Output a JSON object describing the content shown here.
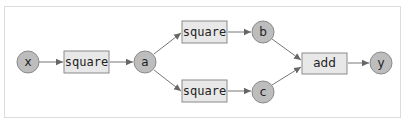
{
  "diagram": {
    "type": "computation-graph",
    "nodes": {
      "x": {
        "label": "x",
        "kind": "variable"
      },
      "sq1": {
        "label": "square",
        "kind": "function"
      },
      "a": {
        "label": "a",
        "kind": "variable"
      },
      "sq2": {
        "label": "square",
        "kind": "function"
      },
      "sq3": {
        "label": "square",
        "kind": "function"
      },
      "b": {
        "label": "b",
        "kind": "variable"
      },
      "c": {
        "label": "c",
        "kind": "variable"
      },
      "add": {
        "label": "add",
        "kind": "function"
      },
      "y": {
        "label": "y",
        "kind": "variable"
      }
    },
    "edges": [
      [
        "x",
        "sq1"
      ],
      [
        "sq1",
        "a"
      ],
      [
        "a",
        "sq2"
      ],
      [
        "a",
        "sq3"
      ],
      [
        "sq2",
        "b"
      ],
      [
        "sq3",
        "c"
      ],
      [
        "b",
        "add"
      ],
      [
        "c",
        "add"
      ],
      [
        "add",
        "y"
      ]
    ],
    "colors": {
      "variable_fill": "#bdbdbd",
      "function_fill": "#e8e8e8",
      "stroke": "#8a8a8a",
      "edge": "#777777"
    }
  }
}
